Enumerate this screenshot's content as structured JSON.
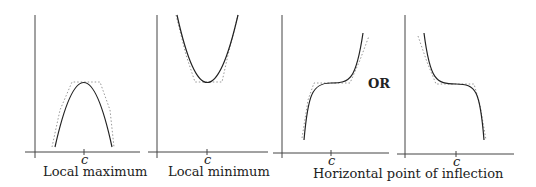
{
  "panels": [
    {
      "id": "local-max",
      "label": "Local maximum",
      "tick_label": "c"
    },
    {
      "id": "local-min",
      "label": "Local minimum",
      "tick_label": "c"
    },
    {
      "id": "inflection-increasing",
      "label": "",
      "tick_label": "c"
    },
    {
      "id": "inflection-decreasing",
      "label": "",
      "tick_label": "c"
    }
  ],
  "shared_label": "Horizontal point of inflection",
  "connector": "OR",
  "colors": {
    "curve": "#222222",
    "axis": "#444444",
    "tangent": "#999999",
    "background": "#ffffff"
  }
}
